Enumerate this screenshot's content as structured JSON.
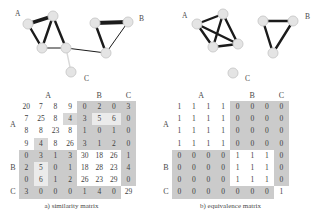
{
  "figure": {
    "colors": {
      "edge": "#1b1b1b",
      "weak_edge": "#d9d9d9",
      "node_fill": "#e4e4e4",
      "node_stroke": "#cdcdcd",
      "cell_gray": "#cbcbcb",
      "cell_gray_soft": "#d7d7d7",
      "cell_light": "#ebebeb",
      "text": "#3d3d3d",
      "label_text": "#4a4a4a"
    },
    "graphs": [
      {
        "name": "similarity-graph",
        "labels": [
          {
            "text": "A",
            "x": 15,
            "y": 16
          },
          {
            "text": "B",
            "x": 139,
            "y": 21
          },
          {
            "text": "C",
            "x": 84,
            "y": 81
          }
        ],
        "nodes": {
          "a1": [
            53,
            16
          ],
          "a2": [
            28,
            24
          ],
          "a3": [
            42,
            48
          ],
          "a4": [
            66,
            48
          ],
          "b1": [
            95,
            23
          ],
          "b2": [
            128,
            22
          ],
          "b3": [
            106,
            53
          ],
          "c": [
            71,
            72
          ]
        },
        "edges": [
          {
            "f": "a2",
            "t": "a1",
            "w": 3.8
          },
          {
            "f": "a1",
            "t": "a3",
            "w": 2.4
          },
          {
            "f": "a1",
            "t": "a4",
            "w": 2.4
          },
          {
            "f": "a2",
            "t": "a3",
            "w": 2.4
          },
          {
            "f": "a3",
            "t": "a4",
            "w": 1
          },
          {
            "f": "a4",
            "t": "b3",
            "w": 1
          },
          {
            "f": "b1",
            "t": "b2",
            "w": 3.8
          },
          {
            "f": "b1",
            "t": "b3",
            "w": 2.4
          },
          {
            "f": "b2",
            "t": "b3",
            "w": 1
          },
          {
            "f": "a4",
            "t": "c",
            "w": 1.4,
            "weak": true
          }
        ]
      },
      {
        "name": "equivalence-graph",
        "labels": [
          {
            "text": "A",
            "x": 182,
            "y": 18
          },
          {
            "text": "B",
            "x": 305,
            "y": 19
          },
          {
            "text": "C",
            "x": 245,
            "y": 81
          }
        ],
        "nodes": {
          "a1": [
            223,
            14
          ],
          "a2": [
            197,
            24
          ],
          "a3": [
            213,
            47
          ],
          "a4": [
            238,
            44
          ],
          "b1": [
            263,
            21
          ],
          "b2": [
            293,
            21
          ],
          "b3": [
            273,
            53
          ],
          "c": [
            233,
            73
          ]
        },
        "edges": [
          {
            "f": "a1",
            "t": "a2",
            "w": 2.4
          },
          {
            "f": "a1",
            "t": "a3",
            "w": 2.4
          },
          {
            "f": "a1",
            "t": "a4",
            "w": 2.4
          },
          {
            "f": "a2",
            "t": "a3",
            "w": 2.4
          },
          {
            "f": "a2",
            "t": "a4",
            "w": 2.4
          },
          {
            "f": "a3",
            "t": "a4",
            "w": 2.4
          },
          {
            "f": "b1",
            "t": "b2",
            "w": 2.4
          },
          {
            "f": "b1",
            "t": "b3",
            "w": 2.4
          },
          {
            "f": "b2",
            "t": "b3",
            "w": 2.4
          }
        ]
      }
    ],
    "matrices": [
      {
        "caption": "a) similarity matrix",
        "col_groups": [
          {
            "label": "A",
            "span": 4
          },
          {
            "label": "B",
            "span": 3
          },
          {
            "label": "C",
            "span": 1
          }
        ],
        "groups": [
          0,
          0,
          0,
          0,
          1,
          1,
          1,
          2
        ],
        "rows": [
          [
            20,
            7,
            8,
            9,
            0,
            2,
            0,
            3
          ],
          [
            7,
            25,
            8,
            4,
            3,
            5,
            6,
            0
          ],
          [
            8,
            8,
            23,
            8,
            1,
            0,
            1,
            0
          ],
          [
            9,
            4,
            8,
            26,
            3,
            1,
            2,
            0
          ],
          [
            0,
            3,
            1,
            3,
            30,
            18,
            26,
            1
          ],
          [
            2,
            5,
            0,
            1,
            18,
            28,
            23,
            4
          ],
          [
            0,
            6,
            1,
            2,
            26,
            23,
            29,
            0
          ],
          [
            3,
            0,
            0,
            0,
            1,
            4,
            0,
            29
          ]
        ],
        "special_gray": [
          [
            1,
            3
          ],
          [
            3,
            1
          ]
        ],
        "special_light": [
          [
            1,
            5
          ],
          [
            1,
            6
          ],
          [
            5,
            1
          ],
          [
            6,
            1
          ]
        ]
      },
      {
        "caption": "b) equivalence matrix",
        "col_groups": [
          {
            "label": "A",
            "span": 4
          },
          {
            "label": "B",
            "span": 3
          },
          {
            "label": "C",
            "span": 1
          }
        ],
        "groups": [
          0,
          0,
          0,
          0,
          1,
          1,
          1,
          2
        ],
        "rows": [
          [
            1,
            1,
            1,
            1,
            0,
            0,
            0,
            0
          ],
          [
            1,
            1,
            1,
            1,
            0,
            0,
            0,
            0
          ],
          [
            1,
            1,
            1,
            1,
            0,
            0,
            0,
            0
          ],
          [
            1,
            1,
            1,
            1,
            0,
            0,
            0,
            0
          ],
          [
            0,
            0,
            0,
            0,
            1,
            1,
            1,
            0
          ],
          [
            0,
            0,
            0,
            0,
            1,
            1,
            1,
            0
          ],
          [
            0,
            0,
            0,
            0,
            1,
            1,
            1,
            0
          ],
          [
            0,
            0,
            0,
            0,
            0,
            0,
            0,
            1
          ]
        ],
        "special_gray": [],
        "special_light": []
      }
    ]
  }
}
